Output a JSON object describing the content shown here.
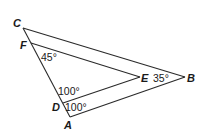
{
  "diagram": {
    "points": {
      "A": "A",
      "B": "B",
      "C": "C",
      "D": "D",
      "E": "E",
      "F": "F"
    },
    "segments": [
      "CA",
      "CB",
      "AB",
      "FE",
      "DE"
    ],
    "angles": {
      "F": "45°",
      "D_upper": "100°",
      "D_lower": "100°",
      "B": "35°"
    }
  }
}
